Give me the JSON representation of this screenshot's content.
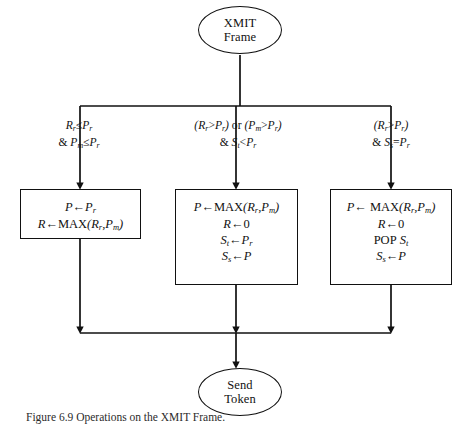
{
  "figure": {
    "caption": "Figure 6.9   Operations on the XMIT Frame."
  },
  "nodes": {
    "start": {
      "line1": "XMIT",
      "line2": "Frame"
    },
    "end": {
      "line1": "Send",
      "line2": "Token"
    }
  },
  "conditions": {
    "left": {
      "line1": "R r ≤ P r",
      "line2": "& P m ≤ P r"
    },
    "middle": {
      "line1": "(R r > P r) or (P m > P r)",
      "line2": "& S t < P r"
    },
    "right": {
      "line1": "(R r > P r)",
      "line2": "& S s = P r"
    }
  },
  "boxes": {
    "left": {
      "lines": [
        "P ← P r",
        "R ← MAX(R r , P m )"
      ]
    },
    "middle": {
      "lines": [
        "P ← MAX(R r , P m )",
        "R ← 0",
        "S t ← P r",
        "S s ← P"
      ]
    },
    "right": {
      "lines": [
        "P ← MAX(R r , P m )",
        "R ← 0",
        "POP S t",
        "S s ← P"
      ]
    }
  },
  "style": {
    "line_color": "#111111",
    "background": "#ffffff"
  }
}
